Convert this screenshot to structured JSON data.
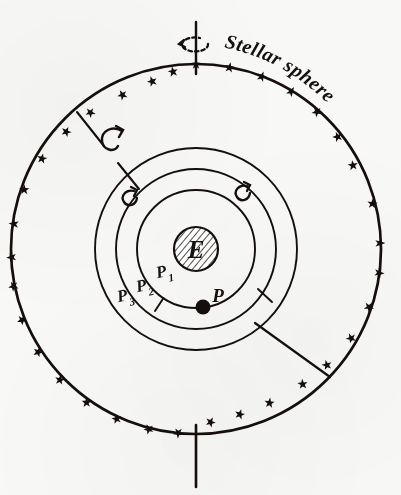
{
  "figure": {
    "background_color": "#f8f8f6",
    "ink_color": "#14110f",
    "labels": {
      "stellar_sphere": "Stellar sphere",
      "earth": "E",
      "planet": "P",
      "sphere_1_base": "P",
      "sphere_1_sub": "1",
      "sphere_2_base": "P",
      "sphere_2_sub": "2",
      "sphere_3_base": "P",
      "sphere_3_sub": "3"
    },
    "geometry": {
      "center_x": 196,
      "center_y": 249,
      "stellar_sphere_radius": 185,
      "sphere_p3_radius": 101,
      "sphere_p2_radius": 80,
      "sphere_p1_radius": 59,
      "earth_radius": 23,
      "planet_x": 203,
      "planet_y": 307,
      "planet_dot_radius": 7,
      "star_marker_count": 34,
      "axis_top_y": 22,
      "axis_bottom_y": 487
    },
    "icons": {
      "rotation_axis": "rotation-axis-icon",
      "axis_spin_arrow": "axis-spin-arrow-icon",
      "hook_arrow_outer": "hook-rotation-arrow-icon",
      "hook_arrow_p3": "hook-rotation-arrow-icon",
      "hook_arrow_p2_left": "hook-rotation-arrow-icon",
      "hook_arrow_p2_right": "hook-rotation-arrow-icon",
      "star_marker": "star-marker-icon",
      "planet_dot": "planet-dot-icon",
      "earth_hatched_disc": "earth-hatched-disc-icon"
    }
  }
}
